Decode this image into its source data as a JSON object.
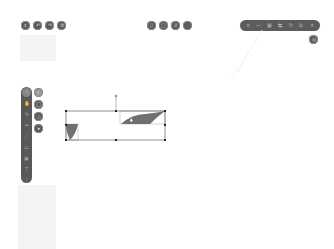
{
  "toolbar_left": {
    "buttons": [
      {
        "name": "menu-button",
        "icon": "menu-icon",
        "glyph": "≡"
      },
      {
        "name": "undo-button",
        "icon": "undo-icon",
        "glyph": "↶"
      },
      {
        "name": "redo-button",
        "icon": "redo-icon",
        "glyph": "↷"
      },
      {
        "name": "settings-button",
        "icon": "gear-icon",
        "glyph": "⚙"
      }
    ]
  },
  "toolbar_center": {
    "buttons": [
      {
        "name": "page-button",
        "icon": "page-icon",
        "glyph": "▯"
      },
      {
        "name": "frame-button",
        "icon": "frame-icon",
        "glyph": "▢"
      },
      {
        "name": "link-button",
        "icon": "link-icon",
        "glyph": "∂"
      },
      {
        "name": "comment-button",
        "icon": "comment-icon",
        "glyph": "◌"
      }
    ]
  },
  "toolbar_right": {
    "items": [
      {
        "name": "align-button",
        "icon": "align-icon",
        "glyph": "≡"
      },
      {
        "name": "distribute-button",
        "icon": "distribute-icon",
        "glyph": "⋯"
      },
      {
        "name": "group-button",
        "icon": "group-icon",
        "glyph": "▦"
      },
      {
        "name": "flip-button",
        "icon": "flip-icon",
        "glyph": "⇆"
      },
      {
        "name": "rotate-button",
        "icon": "rotate-icon",
        "glyph": "↻"
      },
      {
        "name": "duplicate-button",
        "icon": "duplicate-icon",
        "glyph": "⧉"
      },
      {
        "name": "delete-button",
        "icon": "trash-icon",
        "glyph": "✕"
      }
    ],
    "extra": {
      "name": "zoom-button",
      "icon": "zoom-icon",
      "glyph": "◎"
    }
  },
  "palette": {
    "tools": [
      {
        "name": "tool-select",
        "icon": "cursor-icon",
        "glyph": "↖",
        "active": true
      },
      {
        "name": "tool-hand",
        "icon": "hand-icon",
        "glyph": "✋"
      },
      {
        "name": "tool-pencil",
        "icon": "pencil-icon",
        "glyph": "✎"
      },
      {
        "name": "tool-pen",
        "icon": "pen-icon",
        "glyph": "✒"
      },
      {
        "name": "tool-highlighter",
        "icon": "highlighter-icon",
        "glyph": "⁄"
      },
      {
        "name": "tool-eraser",
        "icon": "eraser-icon",
        "glyph": "▭"
      },
      {
        "name": "tool-image",
        "icon": "image-icon",
        "glyph": "▣"
      },
      {
        "name": "tool-text",
        "icon": "text-icon",
        "glyph": "T"
      },
      {
        "name": "tool-more",
        "icon": "more-icon",
        "glyph": "⋮"
      }
    ],
    "side_buttons": [
      {
        "name": "fill-style-button",
        "icon": "fill-icon",
        "glyph": "◐"
      },
      {
        "name": "stroke-style-button",
        "icon": "stroke-icon",
        "glyph": "◯"
      },
      {
        "name": "shape-style-button",
        "icon": "shape-icon",
        "glyph": "△"
      },
      {
        "name": "color-button",
        "icon": "color-icon",
        "glyph": "●"
      }
    ]
  },
  "canvas": {
    "selection": {
      "x": 66,
      "y": 111,
      "w": 99,
      "h": 29,
      "rotate_handle": {
        "x": 116,
        "y": 96
      }
    },
    "shapes": [
      {
        "name": "wedge-shape-left",
        "color": "#6e6e6e"
      },
      {
        "name": "wave-shape-right",
        "color": "#6e6e6e"
      }
    ]
  },
  "colors": {
    "toolbar": "#5a5a5a",
    "canvas": "#ffffff",
    "selection": "#333333"
  }
}
